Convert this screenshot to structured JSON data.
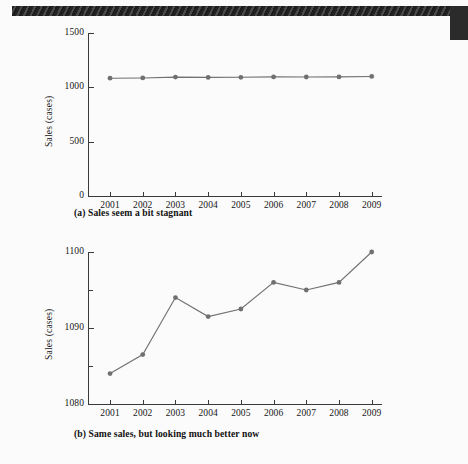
{
  "figure": {
    "decoration": {
      "bar_name": "header-rule",
      "block_name": "corner-block",
      "bar_color": "#2e2e2e",
      "block_color": "#2b2b2b"
    },
    "series_color": "#707070",
    "axis_color": "#3a3a3a",
    "background": "#fbfbfb"
  },
  "chart_data": [
    {
      "type": "line",
      "panel": "a",
      "title": "",
      "caption": "(a) Sales seem a bit stagnant",
      "xlabel": "",
      "ylabel": "Sales (cases)",
      "categories": [
        "2001",
        "2002",
        "2003",
        "2004",
        "2005",
        "2006",
        "2007",
        "2008",
        "2009"
      ],
      "values": [
        1084,
        1086.5,
        1094,
        1091.5,
        1092.5,
        1096,
        1095,
        1096,
        1100
      ],
      "ylim": [
        0,
        1500
      ],
      "yticks": [
        0,
        500,
        1000,
        1500
      ],
      "yticklabels": [
        "0",
        "500",
        "1000",
        "1500"
      ],
      "minor_yticks": [],
      "grid": false,
      "legend": "none",
      "marker": "circle"
    },
    {
      "type": "line",
      "panel": "b",
      "title": "",
      "caption": "(b) Same sales, but looking much better now",
      "xlabel": "",
      "ylabel": "Sales (cases)",
      "categories": [
        "2001",
        "2002",
        "2003",
        "2004",
        "2005",
        "2006",
        "2007",
        "2008",
        "2009"
      ],
      "values": [
        1084,
        1086.5,
        1094,
        1091.5,
        1092.5,
        1096,
        1095,
        1096,
        1100
      ],
      "ylim": [
        1080,
        1100
      ],
      "yticks": [
        1080,
        1090,
        1100
      ],
      "yticklabels": [
        "1080",
        "1090",
        "1100"
      ],
      "minor_yticks": [
        1085,
        1095
      ],
      "grid": false,
      "legend": "none",
      "marker": "circle"
    }
  ]
}
